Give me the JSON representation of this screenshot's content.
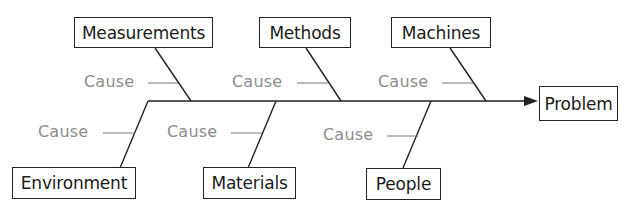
{
  "diagram": {
    "type": "fishbone",
    "effect": "Problem",
    "categories": {
      "top": [
        {
          "label": "Measurements",
          "cause": "Cause"
        },
        {
          "label": "Methods",
          "cause": "Cause"
        },
        {
          "label": "Machines",
          "cause": "Cause"
        }
      ],
      "bottom": [
        {
          "label": "Environment",
          "cause": "Cause"
        },
        {
          "label": "Materials",
          "cause": "Cause"
        },
        {
          "label": "People",
          "cause": "Cause"
        }
      ]
    },
    "colors": {
      "line": "#222222",
      "box_text": "#1a1a1a",
      "cause_text": "#8c8c8c",
      "background": "#ffffff"
    }
  }
}
